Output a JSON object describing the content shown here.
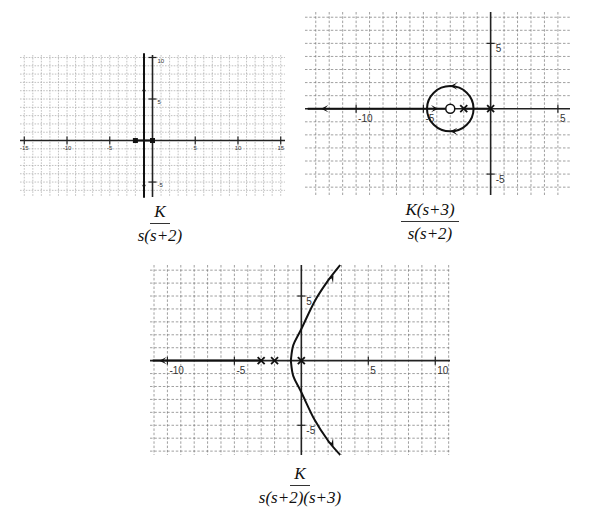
{
  "chart_data": [
    {
      "type": "line",
      "title": "Root locus of K/(s(s+2))",
      "caption": {
        "numerator": "K",
        "denominator": "s(s+2)"
      },
      "xlabel": "",
      "ylabel": "",
      "xlim": [
        -15.5,
        15.5
      ],
      "ylim": [
        -6.8,
        10.3
      ],
      "grid": true,
      "x_ticks": [
        -15,
        -10,
        -5,
        5,
        10,
        15
      ],
      "x_tick_labels": [
        "-15",
        "-10",
        "-5",
        "5",
        "10",
        "15"
      ],
      "y_ticks": [
        10,
        5,
        -5
      ],
      "y_tick_labels": [
        "10",
        "5",
        "-5"
      ],
      "poles": [
        [
          0,
          0
        ],
        [
          -2,
          0
        ]
      ],
      "zeros": [],
      "pole_marker": "square",
      "series": [
        {
          "name": "branch-real",
          "points": [
            [
              -2,
              0
            ],
            [
              0,
              0
            ]
          ]
        },
        {
          "name": "branch-up",
          "points": [
            [
              -1,
              0
            ],
            [
              -1,
              10.5
            ]
          ],
          "arrow_at": [
            -1,
            6.4
          ],
          "arrow_dir": "up"
        },
        {
          "name": "branch-down",
          "points": [
            [
              -1,
              0
            ],
            [
              -1,
              -6.9
            ]
          ],
          "arrow_at": [
            -1,
            -5.8
          ],
          "arrow_dir": "down"
        }
      ]
    },
    {
      "type": "line",
      "title": "Root locus of K(s+3)/(s(s+2))",
      "caption": {
        "numerator": "K(s+3)",
        "denominator": "s(s+2)"
      },
      "xlabel": "",
      "ylabel": "",
      "xlim": [
        -13.8,
        5.9
      ],
      "ylim": [
        -6.6,
        7.4
      ],
      "grid": true,
      "x_ticks": [
        -10,
        -5,
        5
      ],
      "x_tick_labels": [
        "-10",
        "-5",
        "5"
      ],
      "y_ticks": [
        5,
        -5
      ],
      "y_tick_labels": [
        "5",
        "-5"
      ],
      "poles": [
        [
          0,
          0
        ],
        [
          -2,
          0
        ]
      ],
      "zeros": [
        [
          -3,
          0
        ]
      ],
      "pole_marker": "x",
      "zero_marker": "circle",
      "circle": {
        "center": [
          -3,
          0
        ],
        "radius": 1.732
      },
      "series": [
        {
          "name": "branch-left",
          "points": [
            [
              -4.73,
              0
            ],
            [
              -13.6,
              0
            ]
          ],
          "arrow_at": [
            -12.6,
            0
          ],
          "arrow_dir": "left"
        },
        {
          "name": "branch-zero",
          "points": [
            [
              -4.73,
              0
            ],
            [
              -3,
              0
            ]
          ],
          "arrow_at": [
            -3.9,
            0
          ],
          "arrow_dir": "right"
        },
        {
          "name": "branch-poles",
          "points": [
            [
              -2,
              0
            ],
            [
              0,
              0
            ]
          ]
        }
      ],
      "circle_arrows": [
        {
          "at": [
            -3,
            1.732
          ],
          "dir": "left"
        },
        {
          "at": [
            -3,
            -1.732
          ],
          "dir": "left"
        }
      ]
    },
    {
      "type": "line",
      "title": "Root locus of K/(s(s+2)(s+3))",
      "caption": {
        "numerator": "K",
        "denominator": "s(s+2)(s+3)"
      },
      "xlabel": "",
      "ylabel": "",
      "xlim": [
        -11.3,
        11.1
      ],
      "ylim": [
        -7.3,
        7.4
      ],
      "grid": true,
      "x_ticks": [
        -10,
        -5,
        5,
        10
      ],
      "x_tick_labels": [
        "-10",
        "-5",
        "5",
        "10"
      ],
      "y_ticks": [
        5,
        -5
      ],
      "y_tick_labels": [
        "5",
        "-5"
      ],
      "poles": [
        [
          0,
          0
        ],
        [
          -2,
          0
        ],
        [
          -3,
          0
        ]
      ],
      "zeros": [],
      "pole_marker": "x",
      "breakaway": -0.785,
      "asymptote_centroid": -1.667,
      "asymptote_angles_deg": [
        60,
        -60,
        180
      ],
      "imag_axis_crossing": 2.449,
      "series": [
        {
          "name": "branch-left",
          "points": [
            [
              -3,
              0
            ],
            [
              -11.1,
              0
            ]
          ],
          "arrow_at": [
            -10.6,
            0
          ],
          "arrow_dir": "left"
        },
        {
          "name": "branch-upper",
          "points": [
            [
              -0.785,
              0
            ],
            [
              -0.6,
              1.2
            ],
            [
              0,
              2.449
            ],
            [
              1.0,
              4.6
            ],
            [
              2.0,
              6.2
            ],
            [
              2.9,
              7.4
            ]
          ],
          "arrow_at": [
            2.4,
            6.6
          ],
          "arrow_dir": "up-right"
        },
        {
          "name": "branch-lower",
          "points": [
            [
              -0.785,
              0
            ],
            [
              -0.6,
              -1.2
            ],
            [
              0,
              -2.449
            ],
            [
              1.0,
              -4.6
            ],
            [
              2.0,
              -6.2
            ],
            [
              2.9,
              -7.3
            ]
          ],
          "arrow_at": [
            2.4,
            -6.6
          ],
          "arrow_dir": "down-right"
        }
      ]
    }
  ]
}
